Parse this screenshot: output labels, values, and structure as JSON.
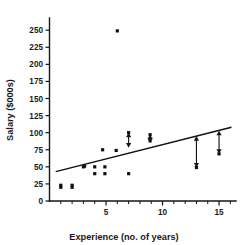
{
  "chart_data": {
    "type": "scatter",
    "title": "",
    "xlabel": "Experience (no. of years)",
    "ylabel": "Salary ($000s)",
    "xlim": [
      0,
      16.5
    ],
    "ylim": [
      0,
      262
    ],
    "grid": false,
    "legend": "none",
    "xticks": [
      5,
      10,
      15
    ],
    "xtick_labels": [
      "5",
      "10",
      "15"
    ],
    "x_minor_ticks": [
      1,
      2,
      3,
      4,
      6,
      7,
      8,
      9,
      11,
      12,
      13,
      14,
      16
    ],
    "yticks": [
      0,
      25,
      50,
      75,
      100,
      125,
      150,
      175,
      200,
      225,
      250
    ],
    "ytick_labels": [
      "0",
      "25",
      "50",
      "75",
      "100",
      "125",
      "150",
      "175",
      "200",
      "225",
      "250"
    ],
    "series": [
      {
        "name": "Observations",
        "marker": "square",
        "color": "#111111",
        "points": [
          {
            "x": 1.0,
            "y": 23
          },
          {
            "x": 1.0,
            "y": 20
          },
          {
            "x": 2.0,
            "y": 23
          },
          {
            "x": 2.0,
            "y": 20
          },
          {
            "x": 3.0,
            "y": 50
          },
          {
            "x": 3.1,
            "y": 51
          },
          {
            "x": 4.0,
            "y": 50
          },
          {
            "x": 4.0,
            "y": 40
          },
          {
            "x": 4.9,
            "y": 50
          },
          {
            "x": 4.9,
            "y": 40
          },
          {
            "x": 4.7,
            "y": 75
          },
          {
            "x": 5.9,
            "y": 74
          },
          {
            "x": 6.0,
            "y": 249
          },
          {
            "x": 7.0,
            "y": 100
          },
          {
            "x": 7.0,
            "y": 40
          },
          {
            "x": 8.9,
            "y": 97
          },
          {
            "x": 8.9,
            "y": 88
          },
          {
            "x": 13.0,
            "y": 49
          },
          {
            "x": 15.0,
            "y": 69
          }
        ]
      }
    ],
    "regression_line": {
      "name": "Least-squares fit line",
      "color": "#111111",
      "x_start": 0.55,
      "y_start": 43,
      "x_end": 16.1,
      "y_end": 108
    },
    "residual_arrows": [
      {
        "x": 7.0,
        "y_point": 100,
        "y_line": 78,
        "direction": "double"
      },
      {
        "x": 8.9,
        "y_point": 97,
        "y_line": 86,
        "direction": "double"
      },
      {
        "x": 13.0,
        "y_point": 49,
        "y_line": 95,
        "direction": "double"
      },
      {
        "x": 15.0,
        "y_point": 69,
        "y_line": 103,
        "direction": "double"
      }
    ],
    "annotations": [
      "Double-headed vertical arrows mark residual distances between observed points and the fitted line"
    ]
  }
}
